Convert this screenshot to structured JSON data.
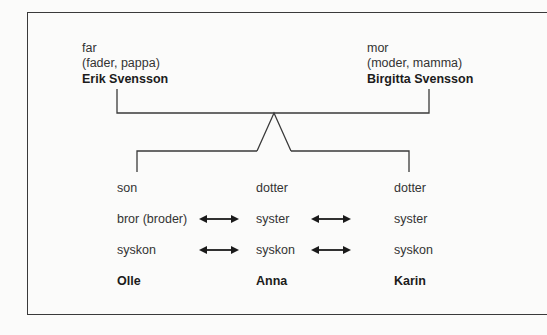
{
  "parents": {
    "father": {
      "role": "far",
      "synonyms": "(fader, pappa)",
      "name": "Erik Svensson"
    },
    "mother": {
      "role": "mor",
      "synonyms": "(moder, mamma)",
      "name": "Birgitta Svensson"
    }
  },
  "children": [
    {
      "role": "son",
      "sibling_term": "bror (broder)",
      "collective": "syskon",
      "name": "Olle"
    },
    {
      "role": "dotter",
      "sibling_term": "syster",
      "collective": "syskon",
      "name": "Anna"
    },
    {
      "role": "dotter",
      "sibling_term": "syster",
      "collective": "syskon",
      "name": "Karin"
    }
  ],
  "arrows": {
    "glyph": "double-headed-arrow",
    "color": "#1a1a1a"
  },
  "colors": {
    "line": "#3a3a3a",
    "background": "#fbfbfa"
  }
}
